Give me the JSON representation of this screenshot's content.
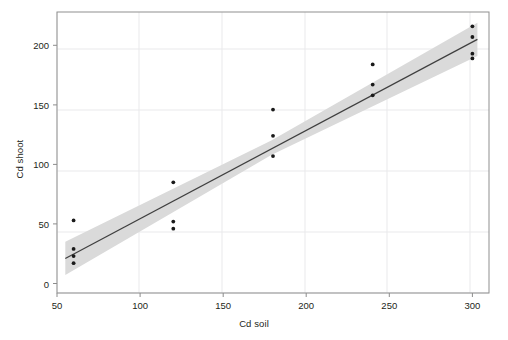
{
  "chart_data": {
    "type": "scatter",
    "title": "",
    "subtitle": "",
    "xlabel": "Cd soil",
    "ylabel": "Cd shoot",
    "xlim": [
      50,
      310
    ],
    "ylim": [
      -8,
      228
    ],
    "xticks": [
      50,
      100,
      150,
      200,
      250,
      300
    ],
    "yticks": [
      0,
      50,
      100,
      150,
      200
    ],
    "xtick_labels": [
      "50",
      "100",
      "150",
      "200",
      "250",
      "300"
    ],
    "ytick_labels": [
      "0",
      "50",
      "100",
      "150",
      "200"
    ],
    "grid": true,
    "grid_color": "#e8e8ea",
    "legend": "none",
    "point_color": "#1a1a1a",
    "line_color": "#3c3c3c",
    "band_color": "#d9d9d9",
    "frame_color": "#8c8c8c",
    "points": [
      {
        "x": 60,
        "y": 53
      },
      {
        "x": 60,
        "y": 29
      },
      {
        "x": 60,
        "y": 23
      },
      {
        "x": 60,
        "y": 17
      },
      {
        "x": 120,
        "y": 85
      },
      {
        "x": 120,
        "y": 52
      },
      {
        "x": 120,
        "y": 46
      },
      {
        "x": 180,
        "y": 146
      },
      {
        "x": 180,
        "y": 124
      },
      {
        "x": 180,
        "y": 107
      },
      {
        "x": 240,
        "y": 184
      },
      {
        "x": 240,
        "y": 167
      },
      {
        "x": 240,
        "y": 158
      },
      {
        "x": 300,
        "y": 216
      },
      {
        "x": 300,
        "y": 207
      },
      {
        "x": 300,
        "y": 193
      },
      {
        "x": 300,
        "y": 189
      }
    ],
    "regression_line": {
      "x_start": 55,
      "y_start": 21,
      "x_end": 303,
      "y_end": 205,
      "slope": 0.742,
      "intercept": -19.8
    },
    "confidence_band": {
      "x_start": 55,
      "x_end": 303,
      "lower_start": 7,
      "upper_start": 35,
      "lower_mid": 108,
      "upper_mid": 120,
      "lower_end": 191,
      "upper_end": 219
    }
  }
}
